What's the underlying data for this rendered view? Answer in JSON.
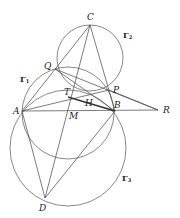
{
  "figure": {
    "points": {
      "C": {
        "label": "C",
        "x": 90,
        "y": 25
      },
      "Q": {
        "label": "Q",
        "x": 55,
        "y": 69
      },
      "P": {
        "label": "P",
        "x": 109,
        "y": 90
      },
      "T": {
        "label": "T",
        "x": 68,
        "y": 97
      },
      "H": {
        "label": "H",
        "x": 88,
        "y": 97
      },
      "A": {
        "label": "A",
        "x": 22,
        "y": 111
      },
      "B": {
        "label": "B",
        "x": 115,
        "y": 111
      },
      "M": {
        "label": "M",
        "x": 68,
        "y": 111
      },
      "R": {
        "label": "R",
        "x": 158,
        "y": 110
      },
      "D": {
        "label": "D",
        "x": 45,
        "y": 198
      }
    },
    "circles": {
      "gamma1": {
        "label": "Γ",
        "sub": "1"
      },
      "gamma2": {
        "label": "Γ",
        "sub": "2"
      },
      "gamma3": {
        "label": "Γ",
        "sub": "3"
      }
    }
  }
}
